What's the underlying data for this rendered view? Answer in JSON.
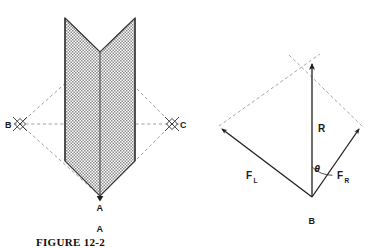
{
  "figure": {
    "caption": "FIGURE 12-2",
    "panels": [
      {
        "id": "A",
        "panel_label": "A",
        "description": "hatched broadhead / chevron shape with construction diamond",
        "points": [
          {
            "name": "A",
            "label": "A",
            "role": "apex-bottom"
          },
          {
            "name": "B",
            "label": "B",
            "role": "left-marker"
          },
          {
            "name": "C",
            "label": "C",
            "role": "right-marker"
          }
        ],
        "markers": [
          "diamond-marker-b",
          "diamond-marker-c"
        ]
      },
      {
        "id": "B",
        "panel_label": "B",
        "description": "force vector parallelogram with resultant",
        "vectors": [
          {
            "name": "F_L",
            "label": "F",
            "subscript": "L",
            "role": "left-force"
          },
          {
            "name": "F_R",
            "label": "F",
            "subscript": "R",
            "role": "right-force"
          },
          {
            "name": "R",
            "label": "R",
            "subscript": "",
            "role": "resultant"
          }
        ],
        "angle": {
          "name": "theta",
          "label": "θ"
        }
      }
    ]
  },
  "colors": {
    "ink": "#1a1a1a",
    "line": "#2b2b2b",
    "dashed": "#8a8a8a",
    "hatch_fill": "#b6b6b6",
    "hatch_stroke": "#7d7d7d",
    "background": "#ffffff"
  }
}
